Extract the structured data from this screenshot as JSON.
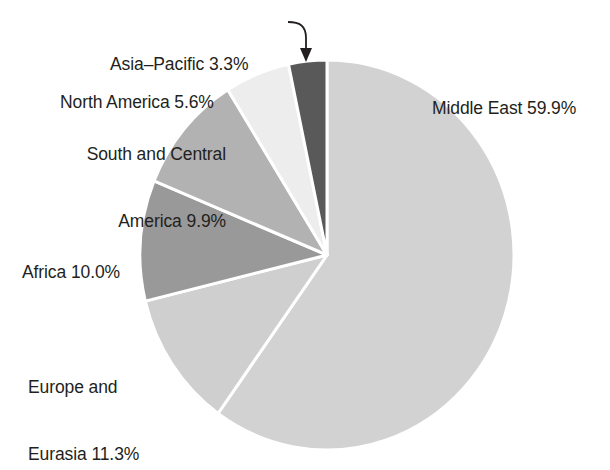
{
  "chart_data": {
    "type": "pie",
    "title": "",
    "subtitle": "",
    "xlabel": "",
    "ylabel": "",
    "legend_position": "callout-labels",
    "grid": false,
    "units": "percent",
    "start_angle_deg": 0,
    "direction": "clockwise",
    "categories": [
      "Middle East",
      "Europe and Eurasia",
      "Africa",
      "South and Central America",
      "North America",
      "Asia-Pacific"
    ],
    "values": [
      59.9,
      11.3,
      10.0,
      9.9,
      5.6,
      3.3
    ],
    "slices": [
      {
        "name": "middle-east",
        "label_line1": "Middle East 59.9%",
        "label_line2": "",
        "value": 59.9,
        "color": "#d2d2d2"
      },
      {
        "name": "europe-and-eurasia",
        "label_line1": "Europe and",
        "label_line2": "Eurasia 11.3%",
        "value": 11.3,
        "color": "#cfcfcf"
      },
      {
        "name": "africa",
        "label_line1": "Africa 10.0%",
        "label_line2": "",
        "value": 10.0,
        "color": "#999999"
      },
      {
        "name": "south-and-central-america",
        "label_line1": "South and Central",
        "label_line2": "America 9.9%",
        "value": 9.9,
        "color": "#b2b2b2"
      },
      {
        "name": "north-america",
        "label_line1": "North America 5.6%",
        "label_line2": "",
        "value": 5.6,
        "color": "#ededed"
      },
      {
        "name": "asia-pacific",
        "label_line1": "Asia–Pacific 3.3%",
        "label_line2": "",
        "value": 3.3,
        "color": "#595959"
      }
    ],
    "callout": {
      "target_slice": "asia-pacific",
      "has_arrow": true,
      "arrow_color": "#231f20"
    },
    "colors": {
      "background": "#ffffff",
      "text": "#231f20",
      "slice_separator": "#ffffff"
    }
  }
}
